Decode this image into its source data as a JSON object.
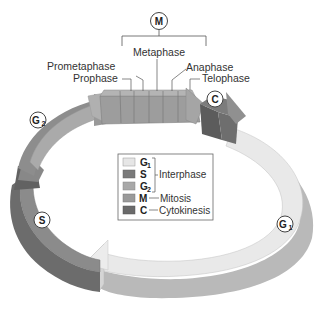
{
  "diagram": {
    "title_badge": "M",
    "mitosis_phases": [
      {
        "label": "Prophase"
      },
      {
        "label": "Prometaphase"
      },
      {
        "label": "Metaphase"
      },
      {
        "label": "Anaphase"
      },
      {
        "label": "Telophase"
      }
    ],
    "ring_badges": {
      "g1": {
        "main": "G",
        "sub": "1"
      },
      "s": {
        "main": "S"
      },
      "g2": {
        "main": "G",
        "sub": "2"
      },
      "c": {
        "main": "C"
      }
    },
    "legend": {
      "items": [
        {
          "key": "G",
          "sub": "1",
          "color": "#e6e6e6"
        },
        {
          "key": "S",
          "sub": "",
          "color": "#7a7a7a"
        },
        {
          "key": "G",
          "sub": "2",
          "color": "#a8a8a8"
        },
        {
          "key": "M",
          "sub": "",
          "color": "#9a9a9a",
          "desc": "Mitosis"
        },
        {
          "key": "C",
          "sub": "",
          "color": "#6a6a6a",
          "desc": "Cytokinesis"
        }
      ],
      "interphase_label": "Interphase",
      "mitosis_label": "Mitosis",
      "cytokinesis_label": "Cytokinesis"
    },
    "colors": {
      "g1_top": "#e8e8e8",
      "g1_side": "#b8b8b8",
      "s_top": "#8a8a8a",
      "s_side": "#6a6a6a",
      "g2_top": "#a9a9a9",
      "g2_side": "#8c8c8c",
      "m_top": "#9c9c9c",
      "m_side": "#888888",
      "c_top": "#6e6e6e",
      "c_side": "#5a5a5a"
    }
  }
}
